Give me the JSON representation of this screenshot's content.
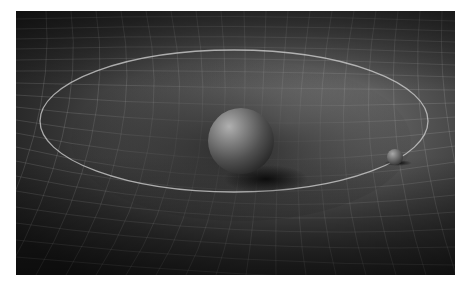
{
  "scene": {
    "description": "Gravity well: large sphere deforming a grid spacetime fabric with a smaller orbiting sphere",
    "colors": {
      "background_dark": "#1e1e1e",
      "background_mid": "#4a4a4a",
      "highlight": "#9a9a9a",
      "grid_line": "#c8c8c8",
      "orbit_line": "#d0d0d0",
      "sphere_light": "#a8a8a8",
      "sphere_dark": "#2a2a2a"
    },
    "orbit": {
      "cx": 218,
      "cy": 110,
      "rx": 194,
      "ry": 71
    },
    "large_sphere": {
      "cx": 225,
      "cy": 130,
      "r": 33
    },
    "small_sphere": {
      "cx": 379,
      "cy": 146,
      "r": 8
    }
  }
}
